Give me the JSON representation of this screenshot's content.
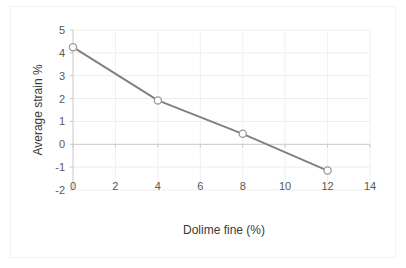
{
  "chart_data": {
    "type": "line",
    "title": "",
    "xlabel": "Dolime fine (%)",
    "ylabel": "Average strain %",
    "x": [
      0,
      4,
      8,
      12
    ],
    "values": [
      4.25,
      1.92,
      0.46,
      -1.15
    ],
    "series": [
      {
        "name": "Average strain",
        "x": [
          0,
          4,
          8,
          12
        ],
        "values": [
          4.25,
          1.92,
          0.46,
          -1.15
        ]
      }
    ],
    "xlim": [
      0,
      14
    ],
    "ylim": [
      -2,
      5
    ],
    "xticks": [
      0,
      2,
      4,
      6,
      8,
      10,
      12,
      14
    ],
    "yticks": [
      5,
      4,
      3,
      2,
      1,
      0,
      -1,
      -2
    ],
    "xtick_labels": [
      "0",
      "2",
      "4",
      "6",
      "8",
      "10",
      "12",
      "14"
    ],
    "ytick_labels": [
      "5",
      "4",
      "3",
      "2",
      "1",
      "0",
      "-1",
      "-2"
    ],
    "grid": true,
    "legend": false,
    "marker": "open-circle",
    "line_color": "#808080",
    "marker_edge_color": "#9a9a9a",
    "marker_face_color": "#ffffff",
    "grid_color": "#ededed",
    "axis_color": "#c9c9c9",
    "background_color": "#ffffff"
  }
}
